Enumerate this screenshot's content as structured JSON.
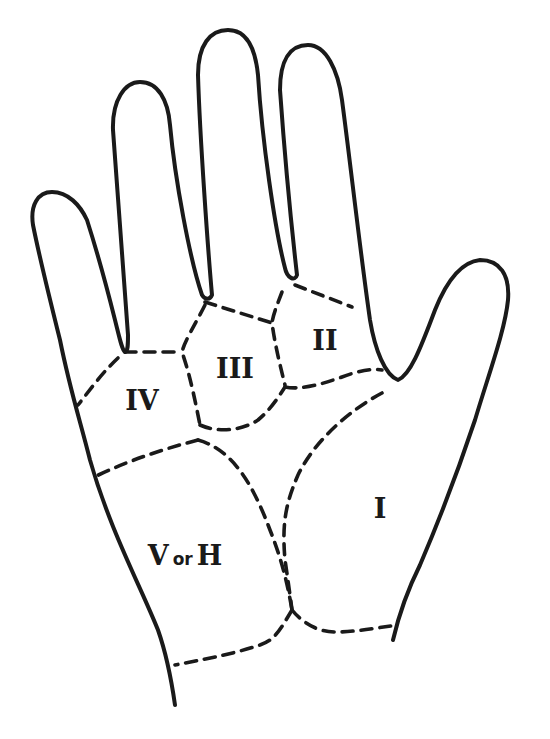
{
  "diagram": {
    "colors": {
      "line": "#1a1a1a",
      "background": "#ffffff"
    },
    "regions": [
      {
        "id": "I",
        "label": "I"
      },
      {
        "id": "II",
        "label": "II"
      },
      {
        "id": "III",
        "label": "III"
      },
      {
        "id": "IV",
        "label": "IV"
      },
      {
        "id": "V",
        "label_main": "V",
        "label_connector": "or",
        "label_alt": "H"
      }
    ]
  }
}
